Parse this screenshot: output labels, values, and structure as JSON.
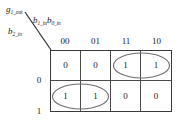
{
  "diagram": {
    "type": "karnaugh-map",
    "output_label": {
      "base": "g",
      "sub": "1_out",
      "full": "g1_out"
    },
    "column_variable_label": {
      "parts": [
        {
          "base": "b",
          "sub": "1_in"
        },
        {
          "base": "b",
          "sub": "0_in"
        }
      ],
      "full": "b1_in b0_in"
    },
    "row_variable_label": {
      "base": "b",
      "sub": "2_in",
      "full": "b2_in"
    },
    "column_headers": [
      "00",
      "01",
      "11",
      "10"
    ],
    "row_headers": [
      "0",
      "1"
    ],
    "cells": [
      [
        "0",
        "0",
        "1",
        "1"
      ],
      [
        "1",
        "1",
        "0",
        "0"
      ]
    ],
    "groups": [
      {
        "name": "group-top-right",
        "row": 0,
        "start_col": 2,
        "span_cols": 2,
        "covers": [
          "1",
          "1"
        ]
      },
      {
        "name": "group-bottom-left",
        "row": 1,
        "start_col": 0,
        "span_cols": 2,
        "covers": [
          "1",
          "1"
        ]
      }
    ],
    "colors": {
      "background": "#ffffff",
      "text": "#1a1a1a",
      "grid_outer": "#3a3a3a",
      "grid_inner": "#4a4a4a",
      "group_ellipse": "#6e6e6e",
      "diagonal": "#3a3a3a"
    }
  }
}
